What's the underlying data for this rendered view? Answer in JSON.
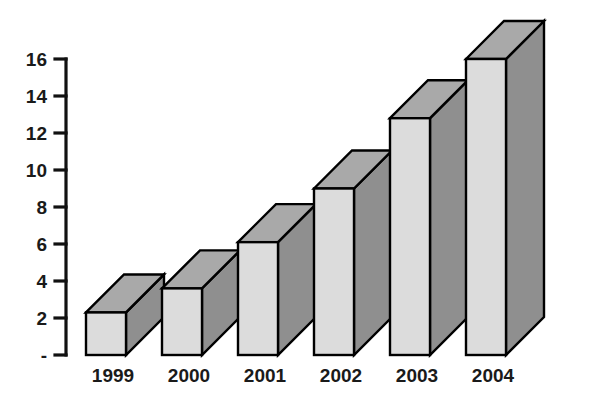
{
  "chart_data": {
    "type": "bar",
    "title": "",
    "subtitle": "",
    "xlabel": "",
    "ylabel": "",
    "categories": [
      "1999",
      "2000",
      "2001",
      "2002",
      "2003",
      "2004"
    ],
    "values": [
      2.3,
      3.6,
      6.1,
      9.0,
      12.8,
      16.0
    ],
    "series": [
      {
        "name": "",
        "values": [
          2.3,
          3.6,
          6.1,
          9.0,
          12.8,
          16.0
        ]
      }
    ],
    "ylim": [
      0,
      16
    ],
    "y_ticks": [
      0,
      2,
      4,
      6,
      8,
      10,
      12,
      14,
      16
    ],
    "y_tick_labels": [
      "-",
      "2",
      "4",
      "6",
      "8",
      "10",
      "12",
      "14",
      "16"
    ],
    "x_tick_labels": [
      "1999",
      "2000",
      "2001",
      "2002",
      "2003",
      "2004"
    ],
    "grid": false,
    "legend": false,
    "legend_position": "none",
    "style": "3d-isometric",
    "annotations": []
  },
  "colors": {
    "background": "#ffffff",
    "bar_front": "#dcdcdc",
    "bar_top": "#a9a9a9",
    "bar_side": "#8f8f8f",
    "outline": "#000000",
    "axis": "#111111",
    "text": "#1a1a1a"
  },
  "axis": {
    "y_axis_name": "value-axis",
    "x_axis_name": "year-axis"
  }
}
